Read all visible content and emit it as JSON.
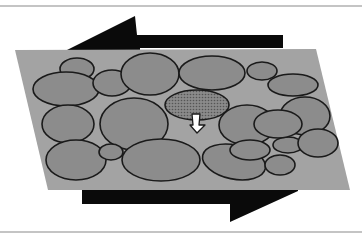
{
  "diagram": {
    "title": "Granular shear diagram",
    "colors": {
      "background": "#ffffff",
      "border_line": "#8a8a8a",
      "layer_fill": "#a3a3a3",
      "grain_fill": "#8c8c8c",
      "grain_stroke": "#1a1a1a",
      "highlight_grain_fill": "#7d7d7d",
      "shear_arrow": "#0a0a0a",
      "displacement_arrow": "#ffffff"
    },
    "shear_arrows": [
      {
        "name": "top-shear-arrow",
        "direction": "left"
      },
      {
        "name": "bottom-shear-arrow",
        "direction": "right"
      }
    ],
    "highlighted_grain": {
      "pattern": "dotted",
      "arrow_direction": "down"
    },
    "grain_count": 24
  }
}
